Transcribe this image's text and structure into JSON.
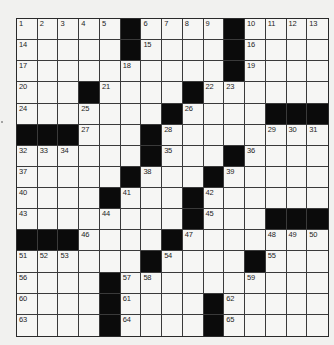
{
  "puzzle": {
    "rows": 15,
    "cols": 15,
    "colors": {
      "page_background": "#f1f1ef",
      "white_cell": "#f6f6f4",
      "black_cell": "#0b0b0b",
      "grid_line": "#3a3a3a",
      "number_text": "#1e1e1e"
    },
    "legend": "Each row string: '#' = black square, '.' = white square, numbers listed separately per cell",
    "grid": [
      [
        1,
        2,
        3,
        4,
        5,
        "#",
        6,
        7,
        8,
        9,
        "#",
        10,
        11,
        12,
        13
      ],
      [
        14,
        ".",
        ".",
        ".",
        ".",
        "#",
        15,
        ".",
        ".",
        ".",
        "#",
        16,
        ".",
        ".",
        "."
      ],
      [
        17,
        ".",
        ".",
        ".",
        ".",
        18,
        ".",
        ".",
        ".",
        ".",
        "#",
        19,
        ".",
        ".",
        "."
      ],
      [
        20,
        ".",
        ".",
        "#",
        21,
        ".",
        ".",
        ".",
        "#",
        22,
        23,
        ".",
        ".",
        ".",
        "."
      ],
      [
        24,
        ".",
        ".",
        25,
        ".",
        ".",
        ".",
        "#",
        26,
        ".",
        ".",
        ".",
        "#",
        "#",
        "#"
      ],
      [
        "#",
        "#",
        "#",
        27,
        ".",
        ".",
        "#",
        28,
        ".",
        ".",
        ".",
        ".",
        29,
        30,
        31
      ],
      [
        32,
        33,
        34,
        ".",
        ".",
        ".",
        "#",
        35,
        ".",
        ".",
        "#",
        36,
        ".",
        ".",
        "."
      ],
      [
        37,
        ".",
        ".",
        ".",
        ".",
        "#",
        38,
        ".",
        ".",
        "#",
        39,
        ".",
        ".",
        ".",
        "."
      ],
      [
        40,
        ".",
        ".",
        ".",
        "#",
        41,
        ".",
        ".",
        "#",
        42,
        ".",
        ".",
        ".",
        ".",
        "."
      ],
      [
        43,
        ".",
        ".",
        ".",
        44,
        ".",
        ".",
        ".",
        "#",
        45,
        ".",
        ".",
        "#",
        "#",
        "#"
      ],
      [
        "#",
        "#",
        "#",
        46,
        ".",
        ".",
        ".",
        "#",
        47,
        ".",
        ".",
        ".",
        48,
        49,
        50
      ],
      [
        51,
        52,
        53,
        ".",
        ".",
        ".",
        "#",
        54,
        ".",
        ".",
        ".",
        "#",
        55,
        ".",
        "."
      ],
      [
        56,
        ".",
        ".",
        ".",
        "#",
        57,
        58,
        ".",
        ".",
        ".",
        ".",
        59,
        ".",
        ".",
        "."
      ],
      [
        60,
        ".",
        ".",
        ".",
        "#",
        61,
        ".",
        ".",
        ".",
        "#",
        62,
        ".",
        ".",
        ".",
        "."
      ],
      [
        63,
        ".",
        ".",
        ".",
        "#",
        64,
        ".",
        ".",
        ".",
        "#",
        65,
        ".",
        ".",
        ".",
        "."
      ]
    ]
  }
}
